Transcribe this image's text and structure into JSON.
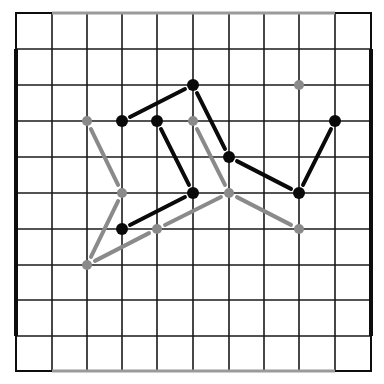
{
  "diagram": {
    "type": "grid-graph",
    "grid": {
      "cols": 10,
      "rows": 10,
      "x_lines": [
        16,
        52,
        87,
        122,
        157,
        193,
        229,
        264,
        299,
        335,
        371
      ],
      "y_lines": [
        13,
        49,
        85,
        121,
        157,
        193,
        229,
        265,
        300,
        336,
        371
      ],
      "line_color": "#1a1a1a",
      "border_thick_color": "#0d0d0d",
      "border_gray_color": "#9a9a9a"
    },
    "colors": {
      "black_graph": "#0a0a0a",
      "gray_graph": "#8a8a8a"
    },
    "black_nodes": [
      [
        5,
        2
      ],
      [
        3,
        3
      ],
      [
        4,
        3
      ],
      [
        9,
        3
      ],
      [
        6,
        4
      ],
      [
        5,
        5
      ],
      [
        8,
        5
      ],
      [
        3,
        6
      ]
    ],
    "black_edges": [
      [
        [
          3,
          3
        ],
        [
          5,
          2
        ]
      ],
      [
        [
          5,
          2
        ],
        [
          6,
          4
        ]
      ],
      [
        [
          4,
          3
        ],
        [
          5,
          5
        ]
      ],
      [
        [
          6,
          4
        ],
        [
          8,
          5
        ]
      ],
      [
        [
          8,
          5
        ],
        [
          9,
          3
        ]
      ],
      [
        [
          3,
          6
        ],
        [
          5,
          5
        ]
      ]
    ],
    "gray_nodes": [
      [
        8,
        2
      ],
      [
        2,
        3
      ],
      [
        5,
        3
      ],
      [
        3,
        5
      ],
      [
        6,
        5
      ],
      [
        4,
        6
      ],
      [
        8,
        6
      ],
      [
        2,
        7
      ]
    ],
    "gray_edges": [
      [
        [
          2,
          3
        ],
        [
          3,
          5
        ]
      ],
      [
        [
          5,
          3
        ],
        [
          6,
          5
        ]
      ],
      [
        [
          3,
          5
        ],
        [
          2,
          7
        ]
      ],
      [
        [
          2,
          7
        ],
        [
          4,
          6
        ]
      ],
      [
        [
          4,
          6
        ],
        [
          6,
          5
        ]
      ],
      [
        [
          6,
          5
        ],
        [
          8,
          6
        ]
      ]
    ]
  }
}
